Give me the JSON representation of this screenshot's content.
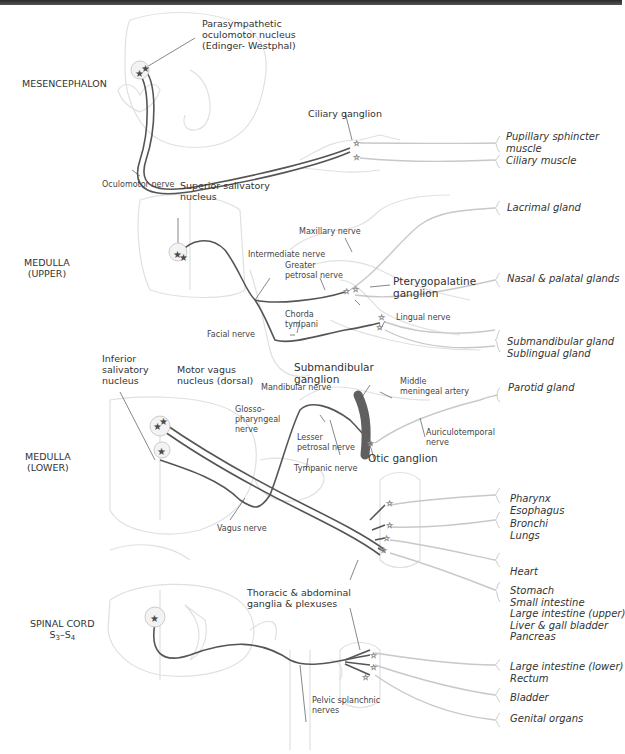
{
  "colors": {
    "preganglionic": "#555555",
    "postganglionic": "#c8c8c8",
    "tissue_outline": "#dddddd",
    "nucleus_star": "#4a4a4a"
  },
  "regions": [
    {
      "label": "MESENCEPHALON"
    },
    {
      "label_line1": "MEDULLA",
      "label_line2": "(UPPER)"
    },
    {
      "label_line1": "MEDULLA",
      "label_line2": "(LOWER)"
    },
    {
      "label_line1": "SPINAL CORD",
      "label_line2_s1": "S",
      "label_line2_sub1": "3",
      "label_line2_dash": "–",
      "label_line2_s2": "S",
      "label_line2_sub2": "4"
    }
  ],
  "nuclei": {
    "edinger_westphal": {
      "line1": "Parasympathetic",
      "line2": "oculomotor nucleus",
      "line3": "(Edinger- Westphal)"
    },
    "superior_salivatory": {
      "line1": "Superior salivatory",
      "line2": "nucleus"
    },
    "inferior_salivatory": {
      "line1": "Inferior",
      "line2": "salivatory",
      "line3": "nucleus"
    },
    "motor_vagus": {
      "line1": "Motor vagus",
      "line2": "nucleus (dorsal)"
    }
  },
  "nerves": {
    "oculomotor": "Oculomotor nerve",
    "maxillary": "Maxillary nerve",
    "intermediate": "Intermediate nerve",
    "greater_petrosal_1": "Greater",
    "greater_petrosal_2": "petrosal nerve",
    "chorda_1": "Chorda",
    "chorda_2": "tympani",
    "facial": "Facial nerve",
    "lingual": "Lingual nerve",
    "mandibular": "Mandibular nerve",
    "glosso_1": "Glosso-",
    "glosso_2": "pharyngeal",
    "glosso_3": "nerve",
    "lesser_petrosal_1": "Lesser",
    "lesser_petrosal_2": "petrosal nerve",
    "tympanic": "Tympanic nerve",
    "auriculotemporal_1": "Auriculotemporal",
    "auriculotemporal_2": "nerve",
    "vagus": "Vagus nerve",
    "pelvic_1": "Pelvic splanchnic",
    "pelvic_2": "nerves",
    "middle_meningeal_1": "Middle",
    "middle_meningeal_2": "meningeal artery"
  },
  "ganglia": {
    "ciliary": "Ciliary ganglion",
    "pterygopalatine_1": "Pterygopalatine",
    "pterygopalatine_2": "ganglion",
    "submandibular_1": "Submandibular",
    "submandibular_2": "ganglion",
    "otic": "Otic ganglion",
    "thoracic_1": "Thoracic & abdominal",
    "thoracic_2": "ganglia & plexuses"
  },
  "targets": [
    "Pupillary sphincter",
    "muscle",
    "Ciliary muscle",
    "Lacrimal gland",
    "Nasal & palatal glands",
    "Submandibular gland",
    "Sublingual gland",
    "Parotid gland",
    "Pharynx",
    "Esophagus",
    "Bronchi",
    "Lungs",
    "Heart",
    "Stomach",
    "Small intestine",
    "Large intestine (upper)",
    "Liver &  gall bladder",
    "Pancreas",
    "Large intestine (lower)",
    "Rectum",
    "Bladder",
    "Genital organs"
  ]
}
